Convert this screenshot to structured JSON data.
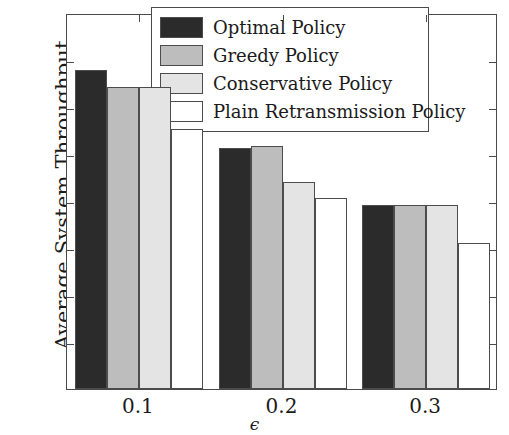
{
  "chart_data": {
    "type": "bar",
    "title": "",
    "xlabel": "ϵ",
    "ylabel": "Average System Throughput",
    "categories": [
      "0.1",
      "0.2",
      "0.3"
    ],
    "ylim": [
      0,
      8
    ],
    "yticks": [
      "0",
      "1",
      "2",
      "3",
      "4",
      "5",
      "6",
      "7",
      "8"
    ],
    "grid": false,
    "legend_position": "top-right-inside",
    "series": [
      {
        "name": "Optimal Policy",
        "color": "#2b2b2b",
        "values": [
          6.78,
          5.12,
          3.92
        ]
      },
      {
        "name": "Greedy Policy",
        "color": "#bdbdbd",
        "values": [
          6.43,
          5.16,
          3.92
        ]
      },
      {
        "name": "Conservative Policy",
        "color": "#e4e4e4",
        "values": [
          6.42,
          4.41,
          3.92
        ]
      },
      {
        "name": "Plain Retransmission Policy",
        "color": "#ffffff",
        "values": [
          5.53,
          4.07,
          3.1
        ]
      }
    ]
  },
  "axes": {
    "y_title": "Average System Throughput",
    "x_title": "ϵ",
    "edge_color": "#4a4a4a"
  }
}
